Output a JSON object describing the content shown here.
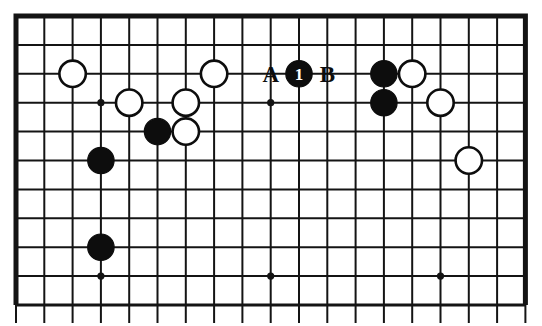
{
  "figure": {
    "kind": "go-board-diagram",
    "board": {
      "columns": 18,
      "rows": 10,
      "origin_x": 16,
      "origin_y": 16,
      "spacing_x": 28.3,
      "spacing_y": 28.9,
      "line_color": "#141414",
      "border_color": "#141414",
      "background_color": "#ffffff",
      "line_width": 2.0,
      "border_width": 5.0,
      "overhang_bottom": 18
    },
    "star_points": [
      {
        "col": 3,
        "row": 3
      },
      {
        "col": 9,
        "row": 3
      },
      {
        "col": 3,
        "row": 9
      },
      {
        "col": 9,
        "row": 9
      },
      {
        "col": 15,
        "row": 9
      }
    ],
    "star_point_radius": 3.6,
    "stone_radius": 13.2,
    "stone_colors": {
      "black_fill": "#0d0d0d",
      "black_stroke": "#0d0d0d",
      "white_fill": "#ffffff",
      "white_stroke": "#0d0d0d",
      "label_on_black": "#ffffff",
      "label_on_white": "#0d0d0d"
    },
    "stones": [
      {
        "id": "w-c2r2",
        "color": "white",
        "col": 2,
        "row": 2,
        "label": ""
      },
      {
        "id": "w-c4r3",
        "color": "white",
        "col": 4,
        "row": 3,
        "label": ""
      },
      {
        "id": "w-c6r3",
        "color": "white",
        "col": 6,
        "row": 3,
        "label": ""
      },
      {
        "id": "w-c7r2",
        "color": "white",
        "col": 7,
        "row": 2,
        "label": ""
      },
      {
        "id": "b-c5r4",
        "color": "black",
        "col": 5,
        "row": 4,
        "label": ""
      },
      {
        "id": "w-c6r4",
        "color": "white",
        "col": 6,
        "row": 4,
        "label": ""
      },
      {
        "id": "b-c3r5",
        "color": "black",
        "col": 3,
        "row": 5,
        "label": ""
      },
      {
        "id": "b-c3r8",
        "color": "black",
        "col": 3,
        "row": 8,
        "label": ""
      },
      {
        "id": "b-c10r2-move1",
        "color": "black",
        "col": 10,
        "row": 2,
        "label": "1"
      },
      {
        "id": "b-c13r2",
        "color": "black",
        "col": 13,
        "row": 2,
        "label": ""
      },
      {
        "id": "w-c14r2",
        "color": "white",
        "col": 14,
        "row": 2,
        "label": ""
      },
      {
        "id": "b-c13r3",
        "color": "black",
        "col": 13,
        "row": 3,
        "label": ""
      },
      {
        "id": "w-c15r3",
        "color": "white",
        "col": 15,
        "row": 3,
        "label": ""
      },
      {
        "id": "w-c16r5",
        "color": "white",
        "col": 16,
        "row": 5,
        "label": ""
      }
    ],
    "point_markers": [
      {
        "id": "marker-a",
        "text": "A",
        "col": 9,
        "row": 2
      },
      {
        "id": "marker-b",
        "text": "B",
        "col": 11,
        "row": 2
      }
    ],
    "move_label_font_size": 17
  }
}
